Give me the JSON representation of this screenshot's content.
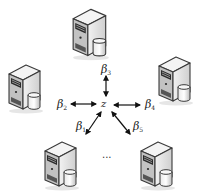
{
  "diagram": {
    "type": "star-network",
    "center": {
      "label": "z"
    },
    "nodes": [
      {
        "id": "top",
        "label_base": "β",
        "label_sub": "3"
      },
      {
        "id": "left",
        "label_base": "β",
        "label_sub": "2"
      },
      {
        "id": "right",
        "label_base": "β",
        "label_sub": "4"
      },
      {
        "id": "bottom-left",
        "label_base": "β",
        "label_sub": "1"
      },
      {
        "id": "bottom-right",
        "label_base": "β",
        "label_sub": "5"
      }
    ],
    "ellipsis": "...",
    "node_icon": "server-with-database-icon",
    "edge_style": "bidirectional-arrow"
  },
  "colors": {
    "background": "#ffffff",
    "server_front": "#d9d9d9",
    "server_side": "#a8a8a8",
    "server_top": "#efefef",
    "server_outline": "#3a3a3a",
    "arrow": "#111111",
    "text": "#222222"
  }
}
